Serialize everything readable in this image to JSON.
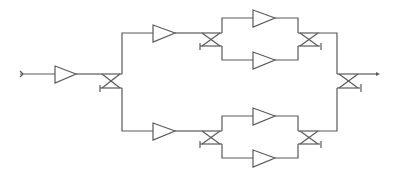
{
  "diagram": {
    "type": "balanced-amplifier-network",
    "background": "#ffffff",
    "line_color": "#5a5a5a",
    "input_amplifier": {
      "x": 55,
      "y": 74
    },
    "splitters": [
      {
        "name": "input-hybrid",
        "x": 100,
        "y": 74
      },
      {
        "name": "upper-hybrid",
        "x": 200,
        "y": 33
      },
      {
        "name": "lower-hybrid",
        "x": 200,
        "y": 131
      }
    ],
    "combiners": [
      {
        "name": "upper-combiner",
        "x": 300,
        "y": 33
      },
      {
        "name": "lower-combiner",
        "x": 300,
        "y": 131
      },
      {
        "name": "output-hybrid",
        "x": 340,
        "y": 74
      }
    ],
    "amplifiers": [
      {
        "name": "upper-driver",
        "x": 153,
        "y": 33
      },
      {
        "name": "lower-driver",
        "x": 153,
        "y": 131
      },
      {
        "name": "upper-final-top",
        "x": 253,
        "y": 18
      },
      {
        "name": "upper-final-bottom",
        "x": 253,
        "y": 60
      },
      {
        "name": "lower-final-top",
        "x": 253,
        "y": 116
      },
      {
        "name": "lower-final-bottom",
        "x": 253,
        "y": 158
      }
    ]
  }
}
